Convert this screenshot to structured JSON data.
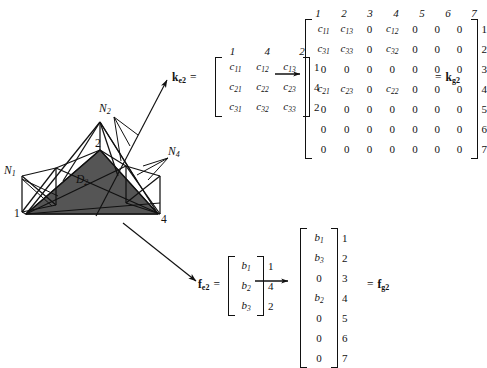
{
  "figure": {
    "kind": "finite-element-assembly-diagram",
    "background_color": "#ffffff",
    "ink_color": "#111111",
    "shaded_face_color": "#555555"
  },
  "mesh": {
    "caption_domain": "D",
    "domain_label_base": "D",
    "domain_label_sub": "2",
    "vertex_labels": [
      {
        "text": "1",
        "x": 14,
        "y": 214
      },
      {
        "text": "2",
        "x": 97,
        "y": 144
      },
      {
        "text": "4",
        "x": 160,
        "y": 220
      }
    ],
    "patch_labels": [
      {
        "base": "N",
        "sub": "1",
        "x": 6,
        "y": 172
      },
      {
        "base": "N",
        "sub": "2",
        "x": 101,
        "y": 110
      },
      {
        "base": "N",
        "sub": "4",
        "x": 170,
        "y": 153
      }
    ]
  },
  "stiffness": {
    "element_symbol_base": "k",
    "element_symbol_sub": "e2",
    "global_symbol_base": "k",
    "global_symbol_sub": "g2",
    "equals": "=",
    "element_col_headers": [
      "1",
      "4",
      "2"
    ],
    "element_row_labels": [
      "1",
      "4",
      "2"
    ],
    "element_rows": [
      [
        {
          "b": "c",
          "s": "11"
        },
        {
          "b": "c",
          "s": "12"
        },
        {
          "b": "c",
          "s": "13"
        }
      ],
      [
        {
          "b": "c",
          "s": "21"
        },
        {
          "b": "c",
          "s": "22"
        },
        {
          "b": "c",
          "s": "23"
        }
      ],
      [
        {
          "b": "c",
          "s": "31"
        },
        {
          "b": "c",
          "s": "32"
        },
        {
          "b": "c",
          "s": "33"
        }
      ]
    ],
    "global_col_headers": [
      "1",
      "2",
      "3",
      "4",
      "5",
      "6",
      "7"
    ],
    "global_row_labels": [
      "1",
      "2",
      "3",
      "4",
      "5",
      "6",
      "7"
    ],
    "global_rows": [
      [
        {
          "b": "c",
          "s": "11"
        },
        {
          "b": "c",
          "s": "13"
        },
        {
          "b": "0"
        },
        {
          "b": "c",
          "s": "12"
        },
        {
          "b": "0"
        },
        {
          "b": "0"
        },
        {
          "b": "0"
        }
      ],
      [
        {
          "b": "c",
          "s": "31"
        },
        {
          "b": "c",
          "s": "33"
        },
        {
          "b": "0"
        },
        {
          "b": "c",
          "s": "32"
        },
        {
          "b": "0"
        },
        {
          "b": "0"
        },
        {
          "b": "0"
        }
      ],
      [
        {
          "b": "0"
        },
        {
          "b": "0"
        },
        {
          "b": "0"
        },
        {
          "b": "0"
        },
        {
          "b": "0"
        },
        {
          "b": "0"
        },
        {
          "b": "0"
        }
      ],
      [
        {
          "b": "c",
          "s": "21"
        },
        {
          "b": "c",
          "s": "23"
        },
        {
          "b": "0"
        },
        {
          "b": "c",
          "s": "22"
        },
        {
          "b": "0"
        },
        {
          "b": "0"
        },
        {
          "b": "0"
        }
      ],
      [
        {
          "b": "0"
        },
        {
          "b": "0"
        },
        {
          "b": "0"
        },
        {
          "b": "0"
        },
        {
          "b": "0"
        },
        {
          "b": "0"
        },
        {
          "b": "0"
        }
      ],
      [
        {
          "b": "0"
        },
        {
          "b": "0"
        },
        {
          "b": "0"
        },
        {
          "b": "0"
        },
        {
          "b": "0"
        },
        {
          "b": "0"
        },
        {
          "b": "0"
        }
      ],
      [
        {
          "b": "0"
        },
        {
          "b": "0"
        },
        {
          "b": "0"
        },
        {
          "b": "0"
        },
        {
          "b": "0"
        },
        {
          "b": "0"
        },
        {
          "b": "0"
        }
      ]
    ]
  },
  "load": {
    "element_symbol_base": "f",
    "element_symbol_sub": "e2",
    "global_symbol_base": "f",
    "global_symbol_sub": "g2",
    "equals": "=",
    "element_row_labels": [
      "1",
      "4",
      "2"
    ],
    "element_rows": [
      [
        {
          "b": "b",
          "s": "1"
        }
      ],
      [
        {
          "b": "b",
          "s": "2"
        }
      ],
      [
        {
          "b": "b",
          "s": "3"
        }
      ]
    ],
    "global_row_labels": [
      "1",
      "2",
      "3",
      "4",
      "5",
      "6",
      "7"
    ],
    "global_rows": [
      [
        {
          "b": "b",
          "s": "1"
        }
      ],
      [
        {
          "b": "b",
          "s": "3"
        }
      ],
      [
        {
          "b": "0"
        }
      ],
      [
        {
          "b": "b",
          "s": "2"
        }
      ],
      [
        {
          "b": "0"
        }
      ],
      [
        {
          "b": "0"
        }
      ],
      [
        {
          "b": "0"
        }
      ]
    ]
  }
}
